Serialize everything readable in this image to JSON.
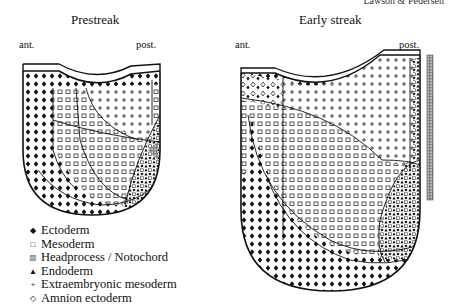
{
  "credit": "Lawson & Pedersen",
  "panels": [
    {
      "title": "Prestreak",
      "ant_label": "ant.",
      "post_label": "post."
    },
    {
      "title": "Early streak",
      "ant_label": "ant.",
      "post_label": "post."
    }
  ],
  "legend": {
    "items": [
      {
        "symbol": "◆",
        "label": "Ectoderm",
        "pattern": "filled-diamond"
      },
      {
        "symbol": "□",
        "label": "Mesoderm",
        "pattern": "open-square"
      },
      {
        "symbol": "▩",
        "label": "Headprocess / Notochord",
        "pattern": "gray-hatch"
      },
      {
        "symbol": "▲",
        "label": "Endoderm",
        "pattern": "filled-triangle"
      },
      {
        "symbol": "+",
        "label": "Extraembryonic mesoderm",
        "pattern": "plus"
      },
      {
        "symbol": "◇",
        "label": "Amnion ectoderm",
        "pattern": "open-diamond"
      }
    ]
  },
  "colors": {
    "ink": "#111111",
    "hatch_gray": "#8a8a8a",
    "background": "#ffffff"
  }
}
